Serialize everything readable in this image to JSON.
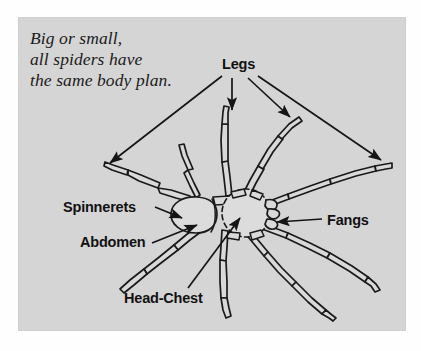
{
  "figure": {
    "kind": "spider-anatomy-diagram",
    "panel_color": "#d5d5d5",
    "page_color": "#fefefe",
    "ink_color": "#1a1a1a",
    "body_fill": "#d9d9d9"
  },
  "caption": {
    "line1": "Big or small,",
    "line2": "all spiders have",
    "line3": "the same body plan."
  },
  "labels": {
    "legs": "Legs",
    "spinnerets": "Spinnerets",
    "abdomen": "Abdomen",
    "fangs": "Fangs",
    "head_chest": "Head-Chest"
  }
}
